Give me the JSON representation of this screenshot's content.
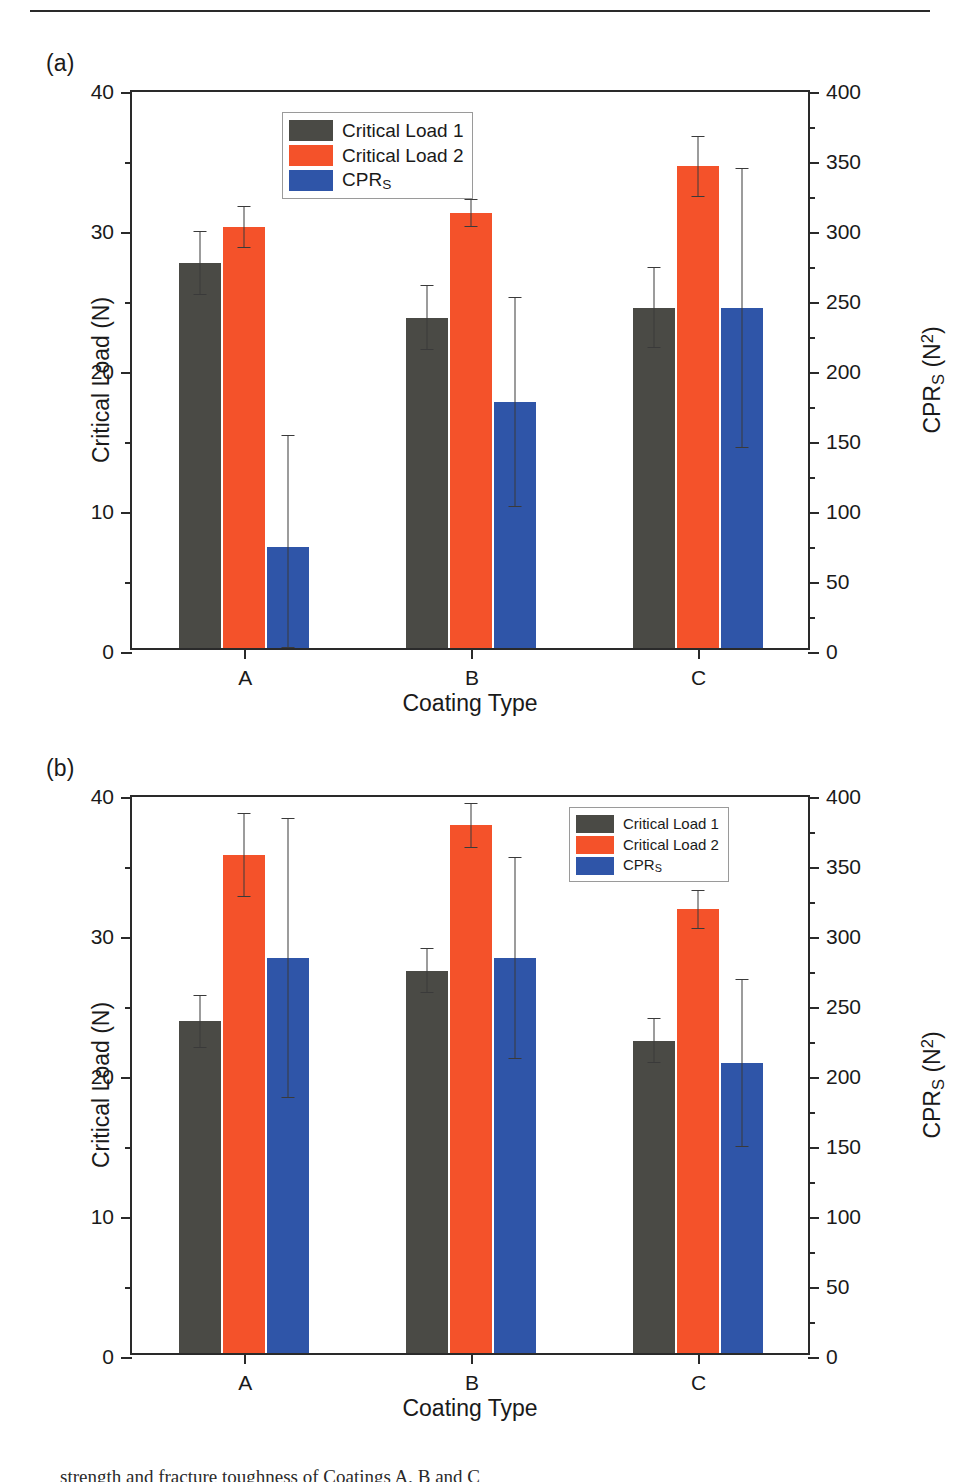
{
  "figure": {
    "top_rule": true,
    "caption_partial": "strength and fracture toughness of Coatings A, B and C"
  },
  "colors": {
    "critical_load_1": "#4a4a45",
    "critical_load_2": "#f4522a",
    "cprs": "#2f55a8",
    "axis": "#2a2a2a"
  },
  "series_names": {
    "s1": "Critical Load 1",
    "s2": "Critical Load 2",
    "s3_prefix": "CPR",
    "s3_sub": "S"
  },
  "axes": {
    "left_title_text": "Critical Load (N)",
    "right_title_prefix": "CPR",
    "right_title_sub": "S",
    "right_title_unit_open": " (N",
    "right_title_sup": "2",
    "right_title_close": ")",
    "x_title": "Coating Type",
    "left_ticks": [
      "0",
      "10",
      "20",
      "30",
      "40"
    ],
    "right_ticks": [
      "0",
      "50",
      "100",
      "150",
      "200",
      "250",
      "300",
      "350",
      "400"
    ],
    "categories": [
      "A",
      "B",
      "C"
    ]
  },
  "panels": [
    {
      "tag": "(a)",
      "legend_position": "top-left"
    },
    {
      "tag": "(b)",
      "legend_position": "top-right"
    }
  ],
  "chart_data": [
    {
      "type": "bar",
      "panel": "(a)",
      "title": "",
      "xlabel": "Coating Type",
      "ylabel": "Critical Load (N)",
      "y2label": "CPR_S (N^2)",
      "ylim": [
        0,
        40
      ],
      "y2lim": [
        0,
        400
      ],
      "yticks": [
        0,
        10,
        20,
        30,
        40
      ],
      "y2ticks": [
        0,
        50,
        100,
        150,
        200,
        250,
        300,
        350,
        400
      ],
      "grid": false,
      "legend_position": "upper left",
      "categories": [
        "A",
        "B",
        "C"
      ],
      "series": [
        {
          "name": "Critical Load 1",
          "axis": "left",
          "unit": "N",
          "values": [
            27.5,
            23.6,
            24.3
          ],
          "errors": [
            2.3,
            2.3,
            2.9
          ]
        },
        {
          "name": "Critical Load 2",
          "axis": "left",
          "unit": "N",
          "values": [
            30.1,
            31.1,
            34.4
          ],
          "errors": [
            1.5,
            1.0,
            2.2
          ]
        },
        {
          "name": "CPR_S",
          "axis": "right",
          "unit": "N^2",
          "values": [
            72,
            176,
            243
          ],
          "errors": [
            80,
            75,
            100
          ]
        }
      ]
    },
    {
      "type": "bar",
      "panel": "(b)",
      "title": "",
      "xlabel": "Coating Type",
      "ylabel": "Critical Load (N)",
      "y2label": "CPR_S (N^2)",
      "ylim": [
        0,
        40
      ],
      "y2lim": [
        0,
        400
      ],
      "yticks": [
        0,
        10,
        20,
        30,
        40
      ],
      "y2ticks": [
        0,
        50,
        100,
        150,
        200,
        250,
        300,
        350,
        400
      ],
      "grid": false,
      "legend_position": "upper right",
      "categories": [
        "A",
        "B",
        "C"
      ],
      "series": [
        {
          "name": "Critical Load 1",
          "axis": "left",
          "unit": "N",
          "values": [
            23.7,
            27.3,
            22.3
          ],
          "errors": [
            1.9,
            1.6,
            1.6
          ]
        },
        {
          "name": "Critical Load 2",
          "axis": "left",
          "unit": "N",
          "values": [
            35.6,
            37.7,
            31.7
          ],
          "errors": [
            3.0,
            1.6,
            1.4
          ]
        },
        {
          "name": "CPR_S",
          "axis": "right",
          "unit": "N^2",
          "values": [
            282,
            282,
            207
          ],
          "errors": [
            100,
            72,
            60
          ]
        }
      ]
    }
  ]
}
